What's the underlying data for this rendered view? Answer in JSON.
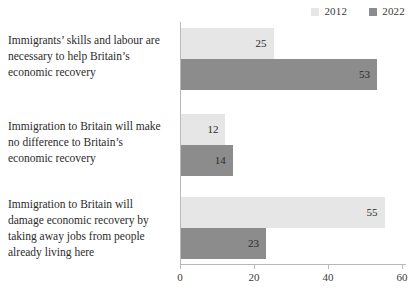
{
  "chart_data": {
    "type": "bar",
    "orientation": "horizontal",
    "title": "",
    "subtitle": "",
    "xlabel": "",
    "ylabel": "",
    "xlim": [
      0,
      60
    ],
    "xticks": [
      0,
      20,
      40,
      60
    ],
    "grid": false,
    "legend_position": "top-right",
    "categories": [
      "Immigrants’ skills and labour are necessary to help Britain’s economic recovery",
      "Immigration to Britain will make no difference to Britain’s economic recovery",
      "Immigration to Britain will damage economic recovery by taking away jobs from people already living here"
    ],
    "category_lines": [
      [
        "Immigrants’ skills and labour are",
        "necessary to help Britain’s",
        "economic recovery"
      ],
      [
        "Immigration to Britain will make",
        "no difference to Britain’s",
        "economic recovery"
      ],
      [
        "Immigration to Britain will",
        "damage economic recovery by",
        "taking away jobs from people",
        "already living here"
      ]
    ],
    "series": [
      {
        "name": "2012",
        "color": "#e6e6e6",
        "values": [
          25,
          12,
          55
        ]
      },
      {
        "name": "2022",
        "color": "#8c8c8c",
        "values": [
          53,
          14,
          23
        ]
      }
    ]
  },
  "legend": {
    "entries": [
      {
        "label": "2012",
        "color": "#e6e6e6"
      },
      {
        "label": "2022",
        "color": "#8c8c8c"
      }
    ]
  },
  "axis": {
    "tick_labels": [
      "0",
      "20",
      "40",
      "60"
    ]
  },
  "values_text": {
    "g0s0": "25",
    "g0s1": "53",
    "g1s0": "12",
    "g1s1": "14",
    "g2s0": "55",
    "g2s1": "23"
  },
  "colors": {
    "series_2012": "#e6e6e6",
    "series_2022": "#8c8c8c",
    "axis": "#b9b9b9",
    "text": "#2b2b2b",
    "background": "#ffffff"
  }
}
